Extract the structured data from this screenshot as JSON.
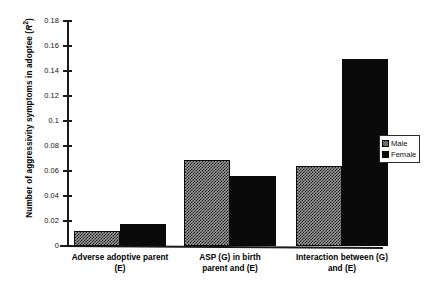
{
  "chart_data": {
    "type": "bar",
    "title": "",
    "xlabel": "",
    "ylabel": "Number of aggressivity symptoms in adoptee (R²)",
    "ylabel_main": "Number of aggressivity symptoms in adoptee (",
    "ylabel_italic": "R",
    "ylabel_sup": "2",
    "ylabel_tail": ")",
    "categories": [
      "Adverse adoptive parent (E)",
      "ASP (G) in birth parent and (E)",
      "Interaction between (G) and (E)"
    ],
    "category_lines": [
      [
        "Adverse adoptive parent",
        "(E)"
      ],
      [
        "ASP (G) in birth",
        "parent and (E)"
      ],
      [
        "Interaction between (G)",
        "and (E)"
      ]
    ],
    "series": [
      {
        "name": "Male",
        "values": [
          0.012,
          0.069,
          0.064
        ],
        "color": "#9d9d9d",
        "pattern": "crosshatch"
      },
      {
        "name": "Female",
        "values": [
          0.018,
          0.056,
          0.15
        ],
        "color": "#0a0a0a",
        "pattern": "solid"
      }
    ],
    "ylim": [
      0,
      0.18
    ],
    "ytick_values": [
      0,
      0.02,
      0.04,
      0.06,
      0.08,
      0.1,
      0.12,
      0.14,
      0.16,
      0.18
    ],
    "ytick_labels": [
      "0",
      "0.02",
      "0.04",
      "0.06",
      "0.08",
      "0.1",
      "0.12",
      "0.14",
      "0.16",
      "0.18"
    ],
    "grid": false,
    "legend_position": "right"
  },
  "legend": {
    "entries": [
      {
        "label": "Male"
      },
      {
        "label": "Female"
      }
    ]
  }
}
